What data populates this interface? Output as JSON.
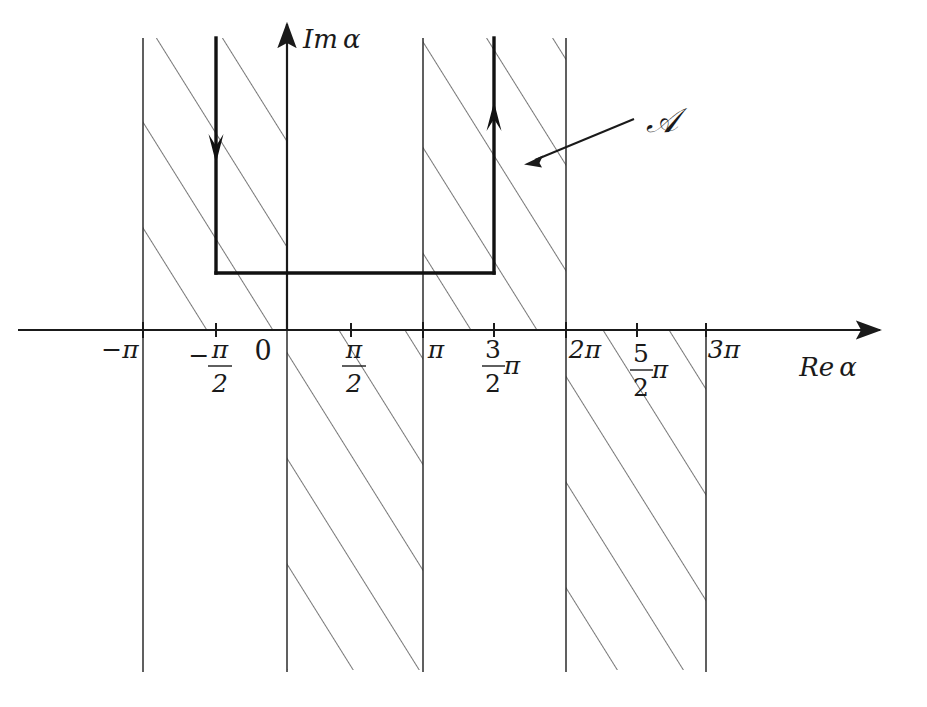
{
  "figure": {
    "axes": {
      "x_axis_label": "Re α",
      "y_axis_label": "Im α",
      "x_axis_name": "real-axis",
      "y_axis_name": "imaginary-axis"
    },
    "region_label": {
      "text": "𝒜",
      "plain": "A",
      "description": "calligraphic A labelling the hatched region"
    },
    "ticks": [
      {
        "id": "neg-pi",
        "label": "−π",
        "value": -3.14159,
        "multiple_of_pi": -1.0,
        "kind": "simple"
      },
      {
        "id": "neg-half-pi",
        "label": "−π/2",
        "value": -1.5708,
        "multiple_of_pi": -0.5,
        "kind": "fraction",
        "sign": "−",
        "numerator": "π",
        "denominator": "2"
      },
      {
        "id": "zero",
        "label": "0",
        "value": 0.0,
        "multiple_of_pi": 0.0,
        "kind": "simple"
      },
      {
        "id": "half-pi",
        "label": "π/2",
        "value": 1.5708,
        "multiple_of_pi": 0.5,
        "kind": "fraction",
        "sign": "",
        "numerator": "π",
        "denominator": "2"
      },
      {
        "id": "pi",
        "label": "π",
        "value": 3.14159,
        "multiple_of_pi": 1.0,
        "kind": "simple"
      },
      {
        "id": "three-half-pi",
        "label": "3π/2",
        "value": 4.71239,
        "multiple_of_pi": 1.5,
        "kind": "fraction-pi",
        "numerator": "3",
        "denominator": "2",
        "suffix": "π"
      },
      {
        "id": "two-pi",
        "label": "2π",
        "value": 6.28319,
        "multiple_of_pi": 2.0,
        "kind": "simple"
      },
      {
        "id": "five-half-pi",
        "label": "5π/2",
        "value": 7.85398,
        "multiple_of_pi": 2.5,
        "kind": "fraction-pi",
        "numerator": "5",
        "denominator": "2",
        "suffix": "π"
      },
      {
        "id": "three-pi",
        "label": "3π",
        "value": 9.42478,
        "multiple_of_pi": 3.0,
        "kind": "simple"
      }
    ],
    "hatched_strips": [
      {
        "id": "strip-upper-left",
        "from_multiple_of_pi": -1,
        "to_multiple_of_pi": 0,
        "half_plane": "upper"
      },
      {
        "id": "strip-lower-left",
        "from_multiple_of_pi": 0,
        "to_multiple_of_pi": 1,
        "half_plane": "lower"
      },
      {
        "id": "strip-upper-right",
        "from_multiple_of_pi": 1,
        "to_multiple_of_pi": 2,
        "half_plane": "upper"
      },
      {
        "id": "strip-lower-right",
        "from_multiple_of_pi": 2,
        "to_multiple_of_pi": 3,
        "half_plane": "lower"
      }
    ],
    "contour": {
      "id": "integration-contour",
      "down_leg_at_multiple_of_pi": -0.5,
      "up_leg_at_multiple_of_pi": 1.5,
      "bottom_imaginary_level": 1.25,
      "down_arrow_direction": "down",
      "up_arrow_direction": "up"
    },
    "colors": {
      "ink": "#1a1a1a",
      "hatch": "#4a4a4a",
      "background": "#ffffff"
    }
  }
}
